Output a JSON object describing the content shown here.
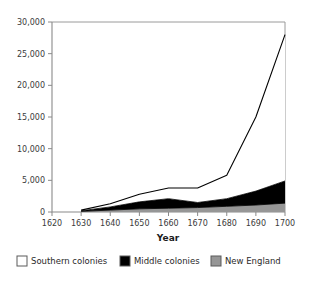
{
  "chart_data": {
    "type": "area",
    "title": "",
    "subtitle": "",
    "xlabel": "Year",
    "ylabel": "",
    "stacked": true,
    "grid": false,
    "legend_position": "bottom",
    "x": [
      1630,
      1640,
      1650,
      1660,
      1670,
      1680,
      1690,
      1700
    ],
    "xlim": [
      1620,
      1700
    ],
    "ylim": [
      0,
      30000
    ],
    "xticks": [
      1620,
      1630,
      1640,
      1650,
      1660,
      1670,
      1680,
      1690,
      1700
    ],
    "xtick_labels": [
      "1620",
      "1630",
      "1640",
      "1650",
      "1660",
      "1670",
      "1680",
      "1690",
      "1700"
    ],
    "yticks": [
      0,
      5000,
      10000,
      15000,
      20000,
      25000,
      30000
    ],
    "ytick_labels": [
      "0",
      "5,000",
      "10,000",
      "15,000",
      "20,000",
      "25,000",
      "30,000"
    ],
    "series": [
      {
        "name": "New England",
        "color": "#969696",
        "values": [
          100,
          300,
          500,
          600,
          700,
          900,
          1100,
          1400
        ]
      },
      {
        "name": "Middle colonies",
        "color": "#000000",
        "values": [
          100,
          500,
          1100,
          1500,
          800,
          1200,
          2200,
          3500
        ]
      },
      {
        "name": "Southern colonies",
        "color": "#ffffff",
        "values": [
          100,
          500,
          1200,
          1700,
          2300,
          3700,
          11700,
          23100
        ]
      }
    ],
    "totals": [
      300,
      1300,
      2800,
      3800,
      3800,
      5800,
      15000,
      28000
    ]
  },
  "legend": {
    "items": [
      {
        "label": "Southern colonies",
        "color": "#ffffff"
      },
      {
        "label": "Middle colonies",
        "color": "#000000"
      },
      {
        "label": "New England",
        "color": "#969696"
      }
    ]
  },
  "axis": {
    "x_title": "Year"
  },
  "colors": {
    "axis": "#8a8a8a",
    "frame": "#9a9a9a",
    "outline": "#000000",
    "text": "#3b3b3b",
    "background": "#ffffff"
  }
}
